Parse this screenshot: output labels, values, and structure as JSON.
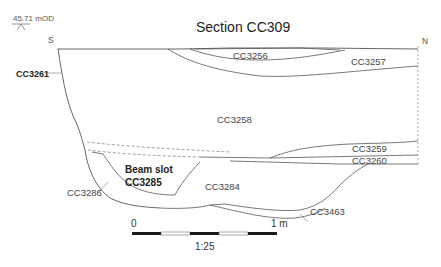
{
  "figure": {
    "title": "Section CC309",
    "datum": {
      "label": "45.71 mOD",
      "icon": "datum-marker-icon"
    },
    "orientation": {
      "left": "S",
      "right": "N"
    }
  },
  "contexts": {
    "cc3256": "CC3256",
    "cc3257": "CC3257",
    "cc3258": "CC3258",
    "cc3259": "CC3259",
    "cc3260": "CC3260",
    "cc3261": "CC3261",
    "cc3284": "CC3284",
    "cc3286": "CC3286",
    "cc3463": "CC3463",
    "beam_slot_line1": "Beam slot",
    "beam_slot_line2": "CC3285"
  },
  "scale_bar": {
    "start_label": "0",
    "end_label": "1 m",
    "ratio": "1:25",
    "segments": 5,
    "colors": {
      "dark": "#1a1a1a",
      "light": "#ffffff"
    }
  },
  "colors": {
    "line": "#555555",
    "dashed": "#888888",
    "background": "#ffffff"
  }
}
